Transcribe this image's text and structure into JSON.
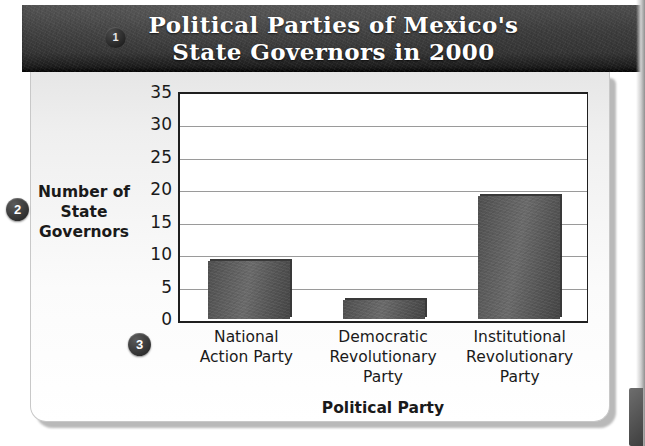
{
  "figure": {
    "title": "Political Parties of Mexico's\nState Governors in 2000",
    "markers": {
      "one": "1",
      "two": "2",
      "three": "3"
    }
  },
  "chart_data": {
    "type": "bar",
    "title": "Political Parties of Mexico's State Governors in 2000",
    "categories": [
      "National\nAction Party",
      "Democratic\nRevolutionary\nParty",
      "Institutional\nRevolutionary\nParty"
    ],
    "values": [
      9,
      3,
      19
    ],
    "xlabel": "Political Party",
    "ylabel": "Number of\nState\nGovernors",
    "ylim": [
      0,
      35
    ],
    "ytick_step": 5,
    "yticks": [
      "35",
      "30",
      "25",
      "20",
      "15",
      "10",
      "5",
      "0"
    ],
    "grid": true,
    "legend": false,
    "bar_color": "#5c5c5c",
    "plot_background": "#ffffff"
  }
}
